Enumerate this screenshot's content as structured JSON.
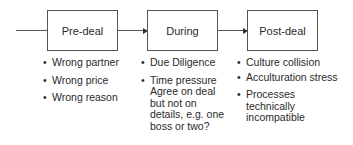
{
  "diagram": {
    "stages": [
      {
        "label": "Pre-deal",
        "bullets": [
          "Wrong partner",
          "Wrong price",
          "Wrong reason"
        ]
      },
      {
        "label": "During",
        "bullets": [
          "Due Diligence",
          "Time pressure Agree on deal but not on details, e.g. one boss or two?"
        ]
      },
      {
        "label": "Post-deal",
        "bullets": [
          "Culture collision",
          "Acculturation stress",
          "Processes technically incompatible"
        ]
      }
    ]
  }
}
